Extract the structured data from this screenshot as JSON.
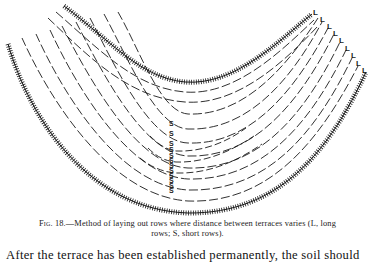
{
  "figure": {
    "number_label": "Fig. 18.",
    "caption": "—Method of laying out rows where distance between terraces varies (L, long rows; S, short rows).",
    "caption_line1": "—Method of laying out rows where distance between terraces varies (L, long",
    "caption_line2": "rows; S, short rows).",
    "markers": {
      "long_row_label": "L",
      "short_row_label": "S",
      "long_row_count": 9,
      "short_row_count": 13
    },
    "elements": [
      "upper-terrace (hatched line)",
      "lower-terrace (hatched line)",
      "dashed crop rows between terraces",
      "L markers along right end of rows",
      "S markers along vertical center line"
    ]
  },
  "body": {
    "text_line": "After the terrace has been established permanently, the soil should"
  },
  "colors": {
    "ink": "#1a1a1a",
    "paper": "#ffffff"
  }
}
